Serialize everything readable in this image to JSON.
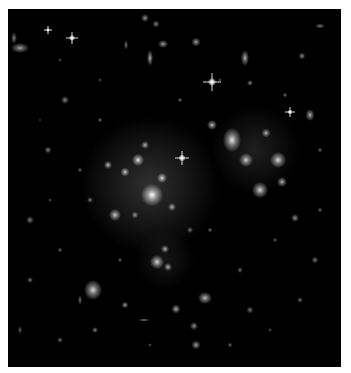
{
  "image": {
    "subject": "galaxy cluster deep field",
    "background": "#000000",
    "border": "#ffffff"
  },
  "haze": [
    {
      "x": 150,
      "y": 185,
      "r": 70,
      "alpha": 0.22
    },
    {
      "x": 255,
      "y": 150,
      "r": 45,
      "alpha": 0.14
    },
    {
      "x": 165,
      "y": 260,
      "r": 30,
      "alpha": 0.1
    }
  ],
  "galaxies": [
    {
      "x": 152,
      "y": 195,
      "w": 22,
      "h": 22,
      "b": 1.0
    },
    {
      "x": 138,
      "y": 160,
      "w": 12,
      "h": 12,
      "b": 0.9
    },
    {
      "x": 162,
      "y": 178,
      "w": 10,
      "h": 10,
      "b": 0.85
    },
    {
      "x": 125,
      "y": 172,
      "w": 9,
      "h": 9,
      "b": 0.8
    },
    {
      "x": 108,
      "y": 165,
      "w": 8,
      "h": 8,
      "b": 0.75
    },
    {
      "x": 145,
      "y": 145,
      "w": 8,
      "h": 8,
      "b": 0.7
    },
    {
      "x": 172,
      "y": 207,
      "w": 8,
      "h": 8,
      "b": 0.7
    },
    {
      "x": 115,
      "y": 215,
      "w": 12,
      "h": 12,
      "b": 0.8
    },
    {
      "x": 135,
      "y": 215,
      "w": 7,
      "h": 7,
      "b": 0.6
    },
    {
      "x": 232,
      "y": 140,
      "w": 18,
      "h": 24,
      "b": 0.9
    },
    {
      "x": 246,
      "y": 160,
      "w": 14,
      "h": 14,
      "b": 0.8
    },
    {
      "x": 278,
      "y": 160,
      "w": 16,
      "h": 16,
      "b": 0.85
    },
    {
      "x": 260,
      "y": 190,
      "w": 16,
      "h": 16,
      "b": 0.85
    },
    {
      "x": 282,
      "y": 182,
      "w": 10,
      "h": 10,
      "b": 0.7
    },
    {
      "x": 212,
      "y": 125,
      "w": 10,
      "h": 10,
      "b": 0.75
    },
    {
      "x": 266,
      "y": 133,
      "w": 9,
      "h": 9,
      "b": 0.7
    },
    {
      "x": 310,
      "y": 115,
      "w": 9,
      "h": 12,
      "b": 0.7
    },
    {
      "x": 295,
      "y": 218,
      "w": 8,
      "h": 8,
      "b": 0.6
    },
    {
      "x": 93,
      "y": 290,
      "w": 18,
      "h": 20,
      "b": 0.85
    },
    {
      "x": 157,
      "y": 262,
      "w": 14,
      "h": 14,
      "b": 0.85
    },
    {
      "x": 168,
      "y": 267,
      "w": 8,
      "h": 8,
      "b": 0.7
    },
    {
      "x": 165,
      "y": 249,
      "w": 8,
      "h": 8,
      "b": 0.7
    },
    {
      "x": 205,
      "y": 298,
      "w": 14,
      "h": 12,
      "b": 0.75
    },
    {
      "x": 176,
      "y": 309,
      "w": 9,
      "h": 9,
      "b": 0.7
    },
    {
      "x": 194,
      "y": 326,
      "w": 8,
      "h": 8,
      "b": 0.6
    },
    {
      "x": 196,
      "y": 345,
      "w": 9,
      "h": 9,
      "b": 0.65
    },
    {
      "x": 144,
      "y": 320,
      "w": 12,
      "h": 3,
      "b": 0.55
    },
    {
      "x": 80,
      "y": 300,
      "w": 4,
      "h": 10,
      "b": 0.5
    },
    {
      "x": 125,
      "y": 305,
      "w": 7,
      "h": 7,
      "b": 0.6
    },
    {
      "x": 95,
      "y": 330,
      "w": 6,
      "h": 6,
      "b": 0.55
    },
    {
      "x": 20,
      "y": 48,
      "w": 18,
      "h": 10,
      "b": 0.65
    },
    {
      "x": 14,
      "y": 38,
      "w": 6,
      "h": 12,
      "b": 0.5
    },
    {
      "x": 145,
      "y": 18,
      "w": 8,
      "h": 8,
      "b": 0.6
    },
    {
      "x": 156,
      "y": 24,
      "w": 7,
      "h": 7,
      "b": 0.55
    },
    {
      "x": 150,
      "y": 58,
      "w": 6,
      "h": 16,
      "b": 0.7
    },
    {
      "x": 163,
      "y": 44,
      "w": 10,
      "h": 8,
      "b": 0.65
    },
    {
      "x": 196,
      "y": 42,
      "w": 9,
      "h": 9,
      "b": 0.65
    },
    {
      "x": 245,
      "y": 58,
      "w": 8,
      "h": 16,
      "b": 0.7
    },
    {
      "x": 250,
      "y": 83,
      "w": 6,
      "h": 6,
      "b": 0.55
    },
    {
      "x": 126,
      "y": 45,
      "w": 4,
      "h": 10,
      "b": 0.5
    },
    {
      "x": 320,
      "y": 26,
      "w": 10,
      "h": 5,
      "b": 0.5
    },
    {
      "x": 302,
      "y": 56,
      "w": 7,
      "h": 7,
      "b": 0.55
    },
    {
      "x": 65,
      "y": 100,
      "w": 8,
      "h": 8,
      "b": 0.55
    },
    {
      "x": 48,
      "y": 150,
      "w": 7,
      "h": 7,
      "b": 0.55
    },
    {
      "x": 30,
      "y": 220,
      "w": 8,
      "h": 8,
      "b": 0.5
    },
    {
      "x": 30,
      "y": 280,
      "w": 6,
      "h": 6,
      "b": 0.5
    },
    {
      "x": 60,
      "y": 250,
      "w": 5,
      "h": 5,
      "b": 0.45
    },
    {
      "x": 315,
      "y": 260,
      "w": 7,
      "h": 7,
      "b": 0.5
    },
    {
      "x": 300,
      "y": 300,
      "w": 6,
      "h": 6,
      "b": 0.45
    },
    {
      "x": 250,
      "y": 310,
      "w": 7,
      "h": 7,
      "b": 0.5
    },
    {
      "x": 240,
      "y": 270,
      "w": 6,
      "h": 6,
      "b": 0.45
    },
    {
      "x": 230,
      "y": 345,
      "w": 5,
      "h": 5,
      "b": 0.45
    },
    {
      "x": 60,
      "y": 340,
      "w": 6,
      "h": 6,
      "b": 0.45
    },
    {
      "x": 20,
      "y": 330,
      "w": 4,
      "h": 8,
      "b": 0.45
    },
    {
      "x": 90,
      "y": 200,
      "w": 6,
      "h": 6,
      "b": 0.5
    },
    {
      "x": 80,
      "y": 170,
      "w": 5,
      "h": 5,
      "b": 0.45
    },
    {
      "x": 190,
      "y": 230,
      "w": 6,
      "h": 6,
      "b": 0.5
    },
    {
      "x": 210,
      "y": 230,
      "w": 5,
      "h": 5,
      "b": 0.45
    },
    {
      "x": 100,
      "y": 120,
      "w": 5,
      "h": 5,
      "b": 0.45
    },
    {
      "x": 180,
      "y": 100,
      "w": 5,
      "h": 5,
      "b": 0.45
    },
    {
      "x": 285,
      "y": 95,
      "w": 5,
      "h": 5,
      "b": 0.45
    },
    {
      "x": 320,
      "y": 150,
      "w": 5,
      "h": 5,
      "b": 0.45
    },
    {
      "x": 320,
      "y": 210,
      "w": 5,
      "h": 5,
      "b": 0.45
    },
    {
      "x": 275,
      "y": 240,
      "w": 5,
      "h": 5,
      "b": 0.4
    },
    {
      "x": 120,
      "y": 260,
      "w": 5,
      "h": 5,
      "b": 0.4
    },
    {
      "x": 50,
      "y": 200,
      "w": 4,
      "h": 4,
      "b": 0.4
    },
    {
      "x": 220,
      "y": 80,
      "w": 4,
      "h": 4,
      "b": 0.4
    },
    {
      "x": 60,
      "y": 60,
      "w": 4,
      "h": 4,
      "b": 0.4
    },
    {
      "x": 100,
      "y": 80,
      "w": 4,
      "h": 4,
      "b": 0.4
    },
    {
      "x": 270,
      "y": 330,
      "w": 4,
      "h": 4,
      "b": 0.4
    },
    {
      "x": 150,
      "y": 345,
      "w": 4,
      "h": 4,
      "b": 0.4
    },
    {
      "x": 40,
      "y": 120,
      "w": 3,
      "h": 3,
      "b": 0.4
    }
  ],
  "stars": [
    {
      "x": 212,
      "y": 82,
      "len": 18,
      "core": 8
    },
    {
      "x": 182,
      "y": 158,
      "len": 14,
      "core": 7
    },
    {
      "x": 72,
      "y": 38,
      "len": 12,
      "core": 6
    },
    {
      "x": 290,
      "y": 112,
      "len": 10,
      "core": 5
    },
    {
      "x": 48,
      "y": 30,
      "len": 8,
      "core": 4
    }
  ]
}
